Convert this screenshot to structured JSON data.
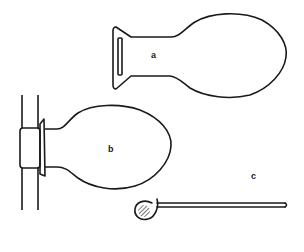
{
  "figure": {
    "background": "#ffffff",
    "stroke_color": "#1a1a1a",
    "objects": [
      {
        "id": "a",
        "label": "a",
        "description": "flask-shaped object with flared rectangular base"
      },
      {
        "id": "b",
        "label": "b",
        "description": "flask-shaped object mounted on vertical rod with collar"
      },
      {
        "id": "c",
        "label": "c",
        "description": "rod with hatched looped end"
      }
    ]
  }
}
